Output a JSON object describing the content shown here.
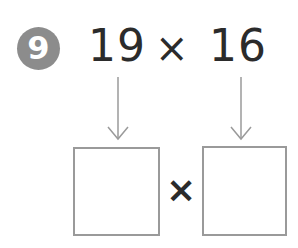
{
  "problem": {
    "number": "9",
    "expression": {
      "left_operand": "19",
      "operator": "×",
      "right_operand": "16"
    },
    "answer_row": {
      "left_box": "",
      "operator": "×",
      "right_box": ""
    }
  },
  "colors": {
    "badge": "#8c8c8c",
    "text": "#2b2b2b",
    "box_border": "#9a9a9a",
    "arrow": "#9a9a9a"
  }
}
